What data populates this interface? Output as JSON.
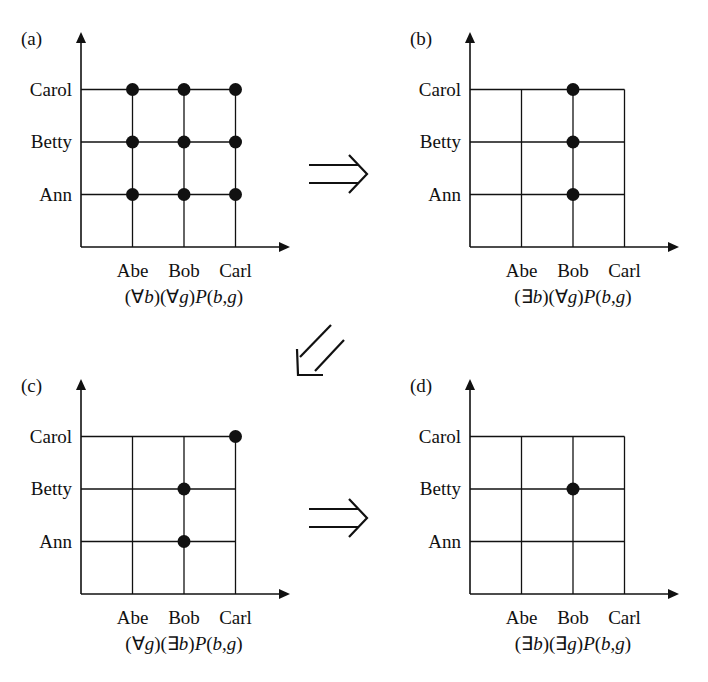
{
  "figure": {
    "panels": [
      {
        "id": "a",
        "label": "(a)",
        "formula_parts": [
          "(",
          "∀",
          "b",
          ")(",
          "∀",
          "g",
          ")",
          "P",
          "(",
          "b",
          ",",
          "g",
          ")"
        ],
        "formula": "(∀b)(∀g)P(b,g)",
        "origin_x": 81,
        "origin_y": 247,
        "dots": [
          [
            0,
            0
          ],
          [
            1,
            0
          ],
          [
            2,
            0
          ],
          [
            0,
            1
          ],
          [
            1,
            1
          ],
          [
            2,
            1
          ],
          [
            0,
            2
          ],
          [
            1,
            2
          ],
          [
            2,
            2
          ]
        ]
      },
      {
        "id": "b",
        "label": "(b)",
        "formula": "(∃b)(∀g)P(b,g)",
        "origin_x": 470,
        "origin_y": 247,
        "dots": [
          [
            1,
            0
          ],
          [
            1,
            1
          ],
          [
            1,
            2
          ]
        ]
      },
      {
        "id": "c",
        "label": "(c)",
        "formula": "(∀g)(∃b)P(b,g)",
        "origin_x": 81,
        "origin_y": 594,
        "dots": [
          [
            1,
            0
          ],
          [
            1,
            1
          ],
          [
            2,
            2
          ]
        ]
      },
      {
        "id": "d",
        "label": "(d)",
        "formula": "(∃b)(∃g)P(b,g)",
        "origin_x": 470,
        "origin_y": 594,
        "dots": [
          [
            1,
            1
          ]
        ]
      }
    ],
    "x_categories": [
      "Abe",
      "Bob",
      "Carl"
    ],
    "y_categories": [
      "Ann",
      "Betty",
      "Carol"
    ],
    "implications": [
      {
        "from": "a",
        "to": "b",
        "symbol": "⇒",
        "direction": "right"
      },
      {
        "from": "b",
        "to": "c",
        "symbol": "⇙",
        "direction": "down-left"
      },
      {
        "from": "c",
        "to": "d",
        "symbol": "⇒",
        "direction": "right"
      }
    ],
    "colors": {
      "ink": "#111111",
      "background": "#ffffff"
    }
  }
}
